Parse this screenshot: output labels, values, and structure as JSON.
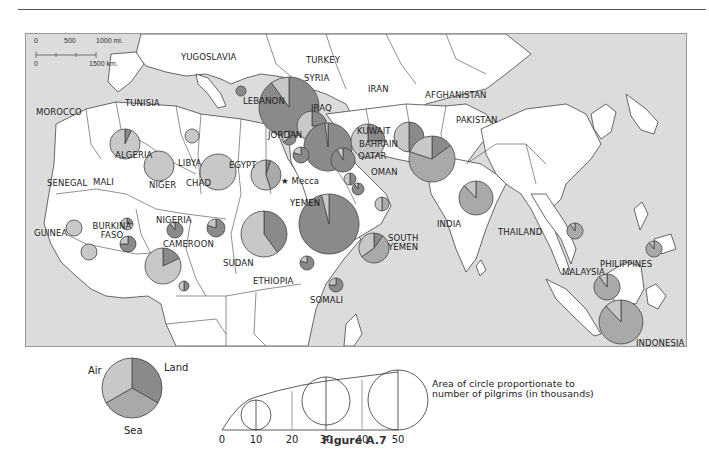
{
  "figure": {
    "caption": "Figure A.7",
    "scale": {
      "mi_ticks": [
        "0",
        "500",
        "1000 mi."
      ],
      "km_ticks": [
        "0",
        "1500 km."
      ]
    },
    "colors": {
      "sea": "#dcdcdc",
      "land": "#ffffff",
      "border": "#444444",
      "air_slice": "#c8c8c8",
      "sea_slice": "#a9a9a9",
      "land_slice": "#8a8a8a"
    },
    "landmark": {
      "symbol": "★",
      "label": "Mecca"
    },
    "countries": [
      {
        "label": "YUGOSLAVIA"
      },
      {
        "label": "TURKEY"
      },
      {
        "label": "SYRIA"
      },
      {
        "label": "LEBANON"
      },
      {
        "label": "IRAQ"
      },
      {
        "label": "IRAN"
      },
      {
        "label": "AFGHANISTAN"
      },
      {
        "label": "PAKISTAN"
      },
      {
        "label": "KUWAIT"
      },
      {
        "label": "BAHRAIN"
      },
      {
        "label": "QATAR"
      },
      {
        "label": "OMAN"
      },
      {
        "label": "JORDAN"
      },
      {
        "label": "MOROCCO"
      },
      {
        "label": "TUNISIA"
      },
      {
        "label": "ALGERIA"
      },
      {
        "label": "LIBYA"
      },
      {
        "label": "EGYPT"
      },
      {
        "label": "SENEGAL"
      },
      {
        "label": "MALI"
      },
      {
        "label": "NIGER"
      },
      {
        "label": "CHAD"
      },
      {
        "label": "GUINEA"
      },
      {
        "label": "BURKINA FASO"
      },
      {
        "label": "NIGERIA"
      },
      {
        "label": "CAMEROON"
      },
      {
        "label": "SUDAN"
      },
      {
        "label": "ETHIOPIA"
      },
      {
        "label": "YEMEN"
      },
      {
        "label": "SOUTH YEMEN"
      },
      {
        "label": "SOMALI"
      },
      {
        "label": "INDIA"
      },
      {
        "label": "THAILAND"
      },
      {
        "label": "MALAYSIA"
      },
      {
        "label": "PHILIPPINES"
      },
      {
        "label": "INDONESIA"
      }
    ],
    "legend": {
      "pie_labels": {
        "air": "Air",
        "land": "Land",
        "sea": "Sea"
      },
      "size_ticks": [
        "0",
        "10",
        "20",
        "30",
        "40",
        "50"
      ],
      "note": "Area of circle proportionate to number of pilgrims (in thousands)"
    }
  },
  "chart_data": {
    "type": "proportional-pie-map",
    "title": "Figure A.7",
    "legend": {
      "slices": [
        "Air",
        "Land",
        "Sea"
      ],
      "size_scale_thousands": [
        0,
        10,
        20,
        30,
        40,
        50
      ]
    },
    "note": "Area of circle proportionate to number of pilgrims (in thousands)",
    "scale": {
      "miles": [
        0,
        500,
        1000
      ],
      "km": [
        0,
        1500
      ]
    },
    "points": [
      {
        "country": "TURKEY",
        "x": 263,
        "y": 73,
        "r": 30,
        "air": 0.1,
        "land": 0.9,
        "sea": 0
      },
      {
        "country": "SYRIA",
        "x": 286,
        "y": 92,
        "r": 15,
        "air": 0.75,
        "land": 0.25,
        "sea": 0
      },
      {
        "country": "IRAQ",
        "x": 302,
        "y": 113,
        "r": 24,
        "air": 0.02,
        "land": 0.98,
        "sea": 0
      },
      {
        "country": "LEBANON",
        "x": 263,
        "y": 104,
        "r": 7,
        "air": 0.35,
        "land": 0.65,
        "sea": 0
      },
      {
        "country": "JORDAN",
        "x": 275,
        "y": 121,
        "r": 8,
        "air": 0.2,
        "land": 0.8,
        "sea": 0
      },
      {
        "country": "KUWAIT",
        "x": 317,
        "y": 126,
        "r": 12,
        "air": 0.08,
        "land": 0.92,
        "sea": 0
      },
      {
        "country": "IRAN",
        "x": 342,
        "y": 107,
        "r": 17,
        "air": 0.75,
        "land": 0.25,
        "sea": 0
      },
      {
        "country": "AFGHANISTAN",
        "x": 383,
        "y": 103,
        "r": 15,
        "air": 0.5,
        "land": 0.5,
        "sea": 0
      },
      {
        "country": "PAKISTAN",
        "x": 406,
        "y": 125,
        "r": 23,
        "air": 0.2,
        "land": 0.15,
        "sea": 0.65
      },
      {
        "country": "YUGOSLAVIA",
        "x": 215,
        "y": 57,
        "r": 5,
        "air": 0,
        "land": 1,
        "sea": 0
      },
      {
        "country": "BAHRAIN",
        "x": 324,
        "y": 145,
        "r": 6,
        "air": 0.5,
        "land": 0.5,
        "sea": 0
      },
      {
        "country": "QATAR",
        "x": 332,
        "y": 155,
        "r": 6,
        "air": 0.1,
        "land": 0.9,
        "sea": 0
      },
      {
        "country": "OMAN",
        "x": 356,
        "y": 170,
        "r": 7,
        "air": 0.5,
        "land": 0,
        "sea": 0.5
      },
      {
        "country": "MOROCCO",
        "x": 99,
        "y": 110,
        "r": 15,
        "air": 0.93,
        "land": 0.07,
        "sea": 0
      },
      {
        "country": "TUNISIA",
        "x": 166,
        "y": 102,
        "r": 7,
        "air": 1,
        "land": 0,
        "sea": 0
      },
      {
        "country": "ALGERIA",
        "x": 133,
        "y": 132,
        "r": 15,
        "air": 1,
        "land": 0,
        "sea": 0
      },
      {
        "country": "LIBYA",
        "x": 192,
        "y": 138,
        "r": 18,
        "air": 1,
        "land": 0,
        "sea": 0
      },
      {
        "country": "EGYPT",
        "x": 240,
        "y": 141,
        "r": 15,
        "air": 0.55,
        "land": 0.05,
        "sea": 0.4
      },
      {
        "country": "SENEGAL",
        "x": 48,
        "y": 194,
        "r": 8,
        "air": 1,
        "land": 0,
        "sea": 0
      },
      {
        "country": "MALI",
        "x": 101,
        "y": 190,
        "r": 6,
        "air": 0.75,
        "land": 0.25,
        "sea": 0
      },
      {
        "country": "NIGER",
        "x": 149,
        "y": 196,
        "r": 8,
        "air": 0.1,
        "land": 0.9,
        "sea": 0
      },
      {
        "country": "CHAD",
        "x": 190,
        "y": 194,
        "r": 9,
        "air": 0.2,
        "land": 0.8,
        "sea": 0
      },
      {
        "country": "GUINEA",
        "x": 63,
        "y": 218,
        "r": 8,
        "air": 1,
        "land": 0,
        "sea": 0
      },
      {
        "country": "BURKINA FASO",
        "x": 102,
        "y": 210,
        "r": 8,
        "air": 0.25,
        "land": 0.75,
        "sea": 0
      },
      {
        "country": "NIGERIA",
        "x": 137,
        "y": 232,
        "r": 18,
        "air": 0.82,
        "land": 0.18,
        "sea": 0
      },
      {
        "country": "CAMEROON",
        "x": 158,
        "y": 252,
        "r": 5,
        "air": 0.5,
        "land": 0.5,
        "sea": 0
      },
      {
        "country": "SUDAN",
        "x": 238,
        "y": 200,
        "r": 23,
        "air": 0.6,
        "land": 0.4,
        "sea": 0
      },
      {
        "country": "ETHIOPIA",
        "x": 281,
        "y": 229,
        "r": 7,
        "air": 0.2,
        "land": 0.8,
        "sea": 0
      },
      {
        "country": "YEMEN",
        "x": 303,
        "y": 190,
        "r": 30,
        "air": 0.04,
        "land": 0.96,
        "sea": 0
      },
      {
        "country": "SOUTH YEMEN",
        "x": 348,
        "y": 214,
        "r": 15,
        "air": 0.35,
        "land": 0.1,
        "sea": 0.55
      },
      {
        "country": "SOMALI",
        "x": 310,
        "y": 251,
        "r": 7,
        "air": 0.25,
        "land": 0.75,
        "sea": 0
      },
      {
        "country": "INDIA",
        "x": 450,
        "y": 164,
        "r": 17,
        "air": 0.12,
        "land": 0,
        "sea": 0.88
      },
      {
        "country": "THAILAND",
        "x": 549,
        "y": 197,
        "r": 8,
        "air": 0.1,
        "land": 0,
        "sea": 0.9
      },
      {
        "country": "MALAYSIA",
        "x": 581,
        "y": 253,
        "r": 13,
        "air": 0.1,
        "land": 0,
        "sea": 0.9
      },
      {
        "country": "PHILIPPINES",
        "x": 628,
        "y": 215,
        "r": 8,
        "air": 0.1,
        "land": 0,
        "sea": 0.9
      },
      {
        "country": "INDONESIA",
        "x": 595,
        "y": 288,
        "r": 22,
        "air": 0.12,
        "land": 0,
        "sea": 0.88
      }
    ]
  }
}
